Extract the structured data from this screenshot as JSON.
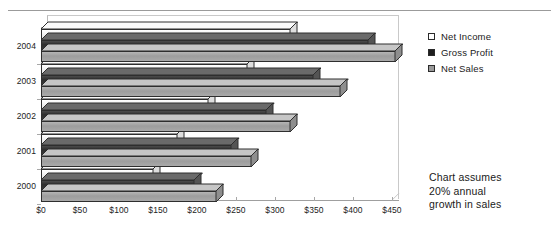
{
  "top_caption_ghost": "",
  "chart_data": {
    "type": "bar",
    "orientation": "horizontal",
    "title": "",
    "subtitle": "",
    "xlabel": "",
    "ylabel": "",
    "categories": [
      "2004",
      "2003",
      "2002",
      "2001",
      "2000"
    ],
    "series": [
      {
        "name": "Net Income",
        "values": [
          320,
          265,
          215,
          175,
          145
        ],
        "color": "#ffffff"
      },
      {
        "name": "Gross Profit",
        "values": [
          420,
          350,
          290,
          245,
          198
        ],
        "color": "#2f2f2f"
      },
      {
        "name": "Net Sales",
        "values": [
          455,
          385,
          320,
          270,
          225
        ],
        "color": "#9d9d9d"
      }
    ],
    "xlim": [
      0,
      450
    ],
    "xticks": [
      0,
      50,
      100,
      150,
      200,
      250,
      300,
      350,
      400,
      450
    ],
    "xticklabels": [
      "$0",
      "$50",
      "$100",
      "$150",
      "$200",
      "$250",
      "$300",
      "$350",
      "$400",
      "$450"
    ],
    "grid": false,
    "legend_position": "right-top",
    "style": "3d-horizontal-bar",
    "annotations": [
      "Chart assumes",
      "20% annual",
      "growth in sales"
    ]
  },
  "legend": {
    "items": [
      {
        "label": "Net Income",
        "marker": "square-white"
      },
      {
        "label": "Gross Profit",
        "marker": "square-black"
      },
      {
        "label": "Net Sales",
        "marker": "square-gray"
      }
    ]
  },
  "annotation": {
    "line1": "Chart assumes",
    "line2": "20% annual",
    "line3": "growth in sales"
  }
}
